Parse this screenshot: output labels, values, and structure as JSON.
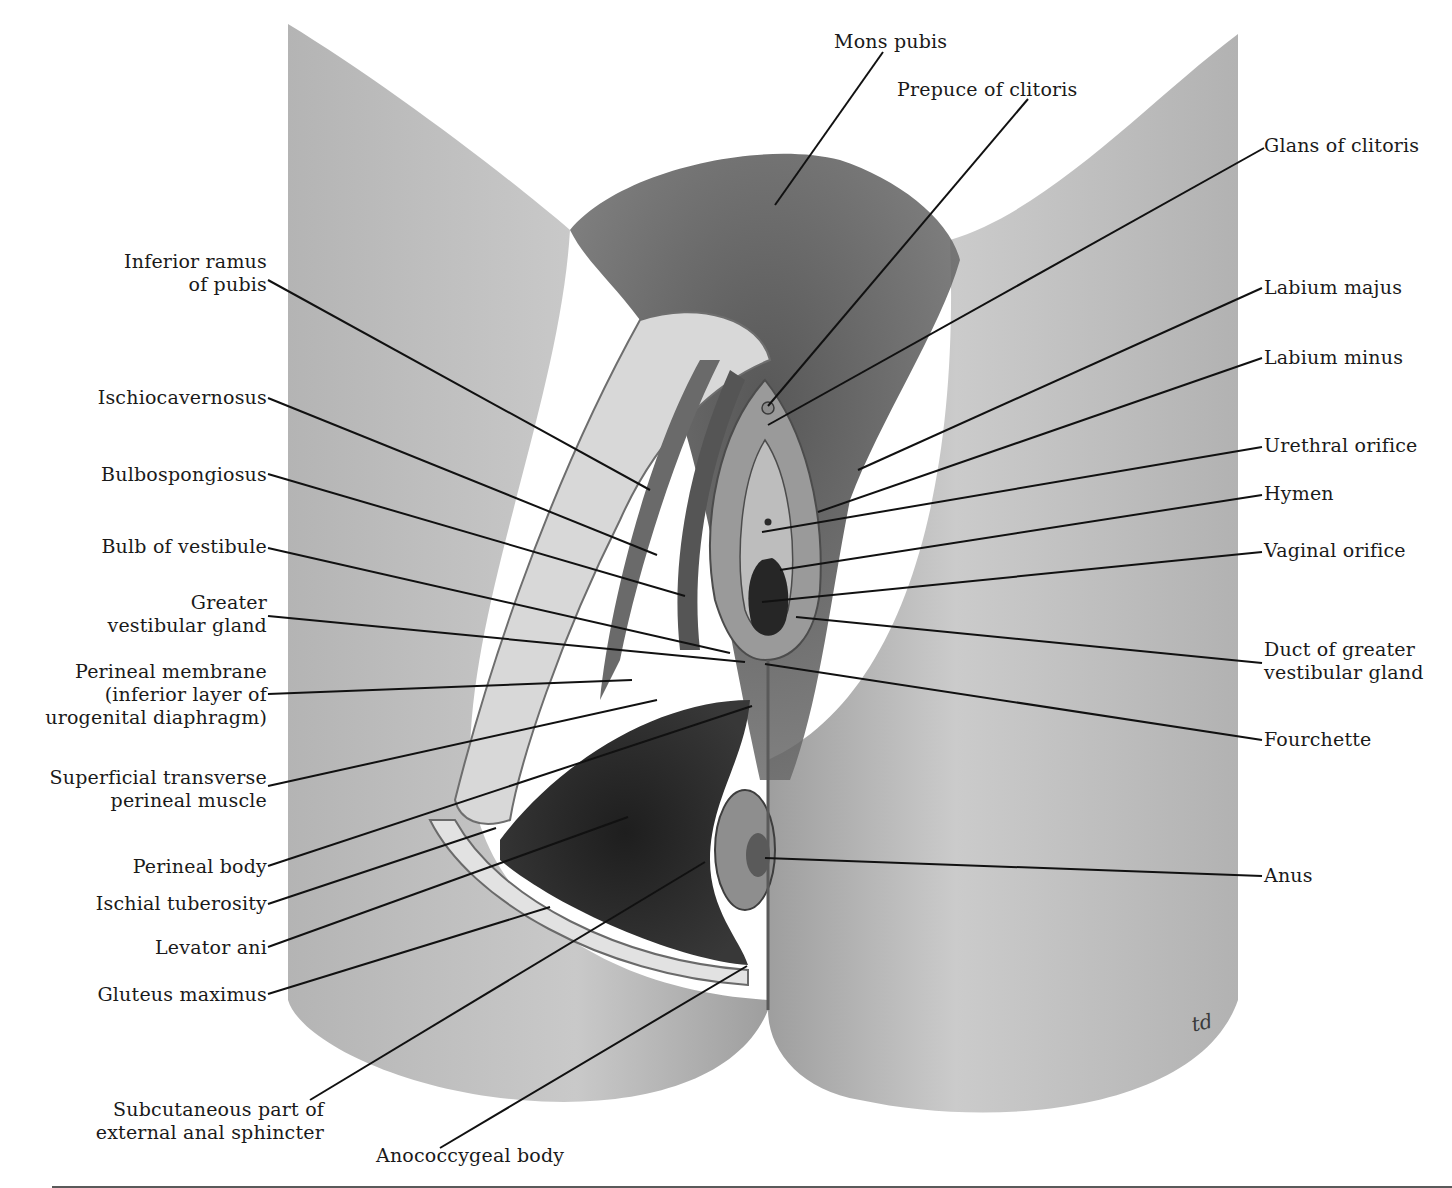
{
  "figure": {
    "signature": "td",
    "colors": {
      "plate": "#a9a9a9",
      "plate_light": "#c8c8c8",
      "dark": "#2b2b2b",
      "hair": "#4a4a4a",
      "leader": "#111111",
      "rule": "#5a5a5a"
    }
  },
  "labels_left": [
    {
      "id": "inferior-ramus-of-pubis",
      "lines": [
        "Inferior ramus",
        "of pubis"
      ]
    },
    {
      "id": "ischiocavernosus",
      "lines": [
        "Ischiocavernosus"
      ]
    },
    {
      "id": "bulbospongiosus",
      "lines": [
        "Bulbospongiosus"
      ]
    },
    {
      "id": "bulb-of-vestibule",
      "lines": [
        "Bulb of vestibule"
      ]
    },
    {
      "id": "greater-vestibular-gland",
      "lines": [
        "Greater",
        "vestibular gland"
      ]
    },
    {
      "id": "perineal-membrane",
      "lines": [
        "Perineal membrane",
        "(inferior layer of",
        "urogenital diaphragm)"
      ]
    },
    {
      "id": "superficial-transverse-perineal-muscle",
      "lines": [
        "Superficial transverse",
        "perineal muscle"
      ]
    },
    {
      "id": "perineal-body",
      "lines": [
        "Perineal body"
      ]
    },
    {
      "id": "ischial-tuberosity",
      "lines": [
        "Ischial tuberosity"
      ]
    },
    {
      "id": "levator-ani",
      "lines": [
        "Levator ani"
      ]
    },
    {
      "id": "gluteus-maximus",
      "lines": [
        "Gluteus maximus"
      ]
    },
    {
      "id": "subcutaneous-part-of-external-anal-sphincter",
      "lines": [
        "Subcutaneous part of",
        "external anal sphincter"
      ]
    }
  ],
  "labels_top": [
    {
      "id": "mons-pubis",
      "lines": [
        "Mons pubis"
      ]
    },
    {
      "id": "prepuce-of-clitoris",
      "lines": [
        "Prepuce of clitoris"
      ]
    }
  ],
  "labels_right": [
    {
      "id": "glans-of-clitoris",
      "lines": [
        "Glans of clitoris"
      ]
    },
    {
      "id": "labium-majus",
      "lines": [
        "Labium majus"
      ]
    },
    {
      "id": "labium-minus",
      "lines": [
        "Labium minus"
      ]
    },
    {
      "id": "urethral-orifice",
      "lines": [
        "Urethral orifice"
      ]
    },
    {
      "id": "hymen",
      "lines": [
        "Hymen"
      ]
    },
    {
      "id": "vaginal-orifice",
      "lines": [
        "Vaginal orifice"
      ]
    },
    {
      "id": "duct-of-greater-vestibular-gland",
      "lines": [
        "Duct of greater",
        "vestibular gland"
      ]
    },
    {
      "id": "fourchette",
      "lines": [
        "Fourchette"
      ]
    },
    {
      "id": "anus",
      "lines": [
        "Anus"
      ]
    }
  ],
  "labels_bottom": [
    {
      "id": "anococcygeal-body",
      "lines": [
        "Anococcygeal body"
      ]
    }
  ]
}
